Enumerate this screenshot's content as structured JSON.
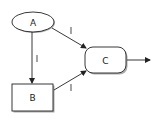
{
  "colors": {
    "stroke": "#222222",
    "fill": "#ffffff",
    "shadow": "#555555"
  },
  "nodes": {
    "a": {
      "label": "A",
      "shape": "ellipse"
    },
    "b": {
      "label": "B",
      "shape": "rectangle"
    },
    "c": {
      "label": "C",
      "shape": "rounded-rectangle"
    }
  },
  "edges": [
    {
      "from": "A",
      "to": "B",
      "label": "I"
    },
    {
      "from": "A",
      "to": "C",
      "label": "I"
    },
    {
      "from": "B",
      "to": "C",
      "label": "I"
    },
    {
      "from": "C",
      "to": "output",
      "label": ""
    }
  ]
}
